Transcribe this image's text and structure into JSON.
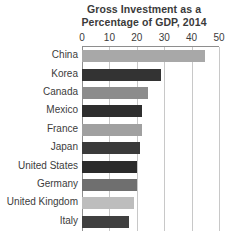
{
  "chart_data": {
    "type": "bar",
    "orientation": "horizontal",
    "title": "Gross Investment as a Percentage of GDP, 2014",
    "title_lines": [
      "Gross Investment as a",
      "Percentage of GDP, 2014"
    ],
    "xlabel": "",
    "ylabel": "",
    "xlim": [
      0,
      50
    ],
    "xticks": [
      0,
      10,
      20,
      30,
      40,
      50
    ],
    "xtick_labels": [
      "0",
      "10",
      "20",
      "30",
      "40",
      "50"
    ],
    "grid": "vertical",
    "legend": "none",
    "categories": [
      "China",
      "Korea",
      "Canada",
      "Mexico",
      "France",
      "Japan",
      "United States",
      "Germany",
      "United Kingdom",
      "Italy"
    ],
    "values": [
      45,
      29,
      24,
      22,
      22,
      21,
      20,
      20,
      19,
      17
    ],
    "bar_colors": [
      "#a8a8a8",
      "#333333",
      "#8c8c8c",
      "#2e2e2e",
      "#a0a0a0",
      "#3a3a3a",
      "#2b2b2b",
      "#6f6f6f",
      "#bdbdbd",
      "#404040"
    ],
    "axis_color": "#8e8e8e",
    "gridline_color": "#c8c8c8",
    "background_color": "#ffffff",
    "text_color": "#3c3c3c"
  }
}
